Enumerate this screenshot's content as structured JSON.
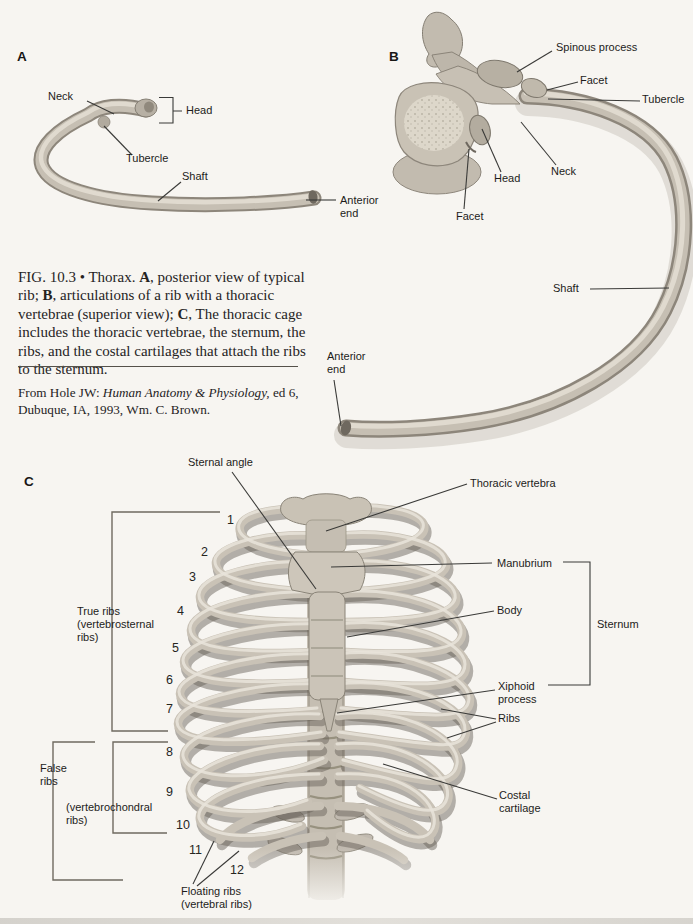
{
  "figure": {
    "caption_segments": [
      {
        "text": "FIG. 10.3 • Thorax. "
      },
      {
        "text": "A",
        "bold": true
      },
      {
        "text": ", posterior view of typical rib; "
      },
      {
        "text": "B",
        "bold": true
      },
      {
        "text": ", articulations of a rib with a thoracic vertebrae (superior view); "
      },
      {
        "text": "C",
        "bold": true
      },
      {
        "text": ", The thoracic cage includes the thoracic vertebrae, the sternum, the ribs, and the costal cartilages that attach the ribs to the sternum."
      }
    ],
    "source_segments": [
      {
        "text": "From Hole JW: "
      },
      {
        "text": "Human Anatomy & Physiology,",
        "italic": true
      },
      {
        "text": " ed 6, Dubuque, IA, 1993, Wm. C. Brown."
      }
    ]
  },
  "panelA": {
    "tag": "A",
    "neck": "Neck",
    "head": "Head",
    "tubercle": "Tubercle",
    "shaft": "Shaft",
    "anterior_end": "Anterior\nend"
  },
  "panelB": {
    "tag": "B",
    "spinous_process": "Spinous process",
    "facet_upper": "Facet",
    "tubercle": "Tubercle",
    "neck": "Neck",
    "head": "Head",
    "facet_lower": "Facet",
    "shaft": "Shaft",
    "anterior_end": "Anterior\nend"
  },
  "panelC": {
    "tag": "C",
    "sternal_angle": "Sternal angle",
    "thoracic_vertebra": "Thoracic vertebra",
    "manubrium": "Manubrium",
    "body": "Body",
    "sternum": "Sternum",
    "xiphoid_process": "Xiphoid\nprocess",
    "ribs": "Ribs",
    "costal_cartilage": "Costal\ncartilage",
    "true_ribs": "True ribs\n(vertebrosternal\nribs)",
    "false_ribs": "False\nribs",
    "vertebrochondral_ribs": "(vertebrochondral\nribs)",
    "floating_ribs": "Floating ribs\n(vertebral ribs)",
    "rib_numbers": [
      "1",
      "2",
      "3",
      "4",
      "5",
      "6",
      "7",
      "8",
      "9",
      "10",
      "11",
      "12"
    ]
  },
  "colors": {
    "background": "#f7f5f1",
    "bone": "#c9c2b6",
    "bone_shadow": "#666158",
    "bone_highlight": "#e9e4da",
    "label_text": "#1d1c1a",
    "leader_line": "#3a3a38"
  }
}
